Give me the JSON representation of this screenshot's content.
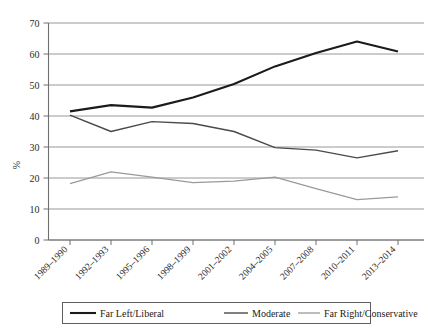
{
  "chart_data": {
    "type": "line",
    "title": "",
    "subtitle": "",
    "xlabel": "",
    "ylabel": "%",
    "ylim": [
      0,
      70
    ],
    "ytick_values": [
      0,
      10,
      20,
      30,
      40,
      50,
      60,
      70
    ],
    "ytick_labels": [
      "0",
      "10",
      "20",
      "30",
      "40",
      "50",
      "60",
      "70"
    ],
    "grid": true,
    "grid_axis": "y",
    "legend_position": "bottom",
    "categories": [
      "1989–1990",
      "1992–1993",
      "1995–1996",
      "1998–1999",
      "2001–2002",
      "2004–2005",
      "2007–2008",
      "2010–2011",
      "2013–2014"
    ],
    "series": [
      {
        "name": "Far Left/Liberal",
        "color": "#1b1b1b",
        "width": 2.1,
        "values": [
          41.5,
          43.5,
          42.7,
          46.0,
          50.3,
          56.0,
          60.3,
          64.0,
          60.8
        ]
      },
      {
        "name": "Moderate",
        "color": "#4a4a4a",
        "width": 1.4,
        "values": [
          40.3,
          35.0,
          38.2,
          37.6,
          35.0,
          29.8,
          29.0,
          26.5,
          28.8
        ]
      },
      {
        "name": "Far Right/Conservative",
        "color": "#9a9a9a",
        "width": 1.3,
        "values": [
          18.2,
          22.0,
          20.3,
          18.5,
          19.0,
          20.3,
          16.6,
          13.0,
          13.9
        ]
      }
    ]
  },
  "legend": {
    "items": [
      {
        "label": "Far Left/Liberal"
      },
      {
        "label": "Moderate"
      },
      {
        "label": "Far Right/Conservative"
      }
    ]
  }
}
